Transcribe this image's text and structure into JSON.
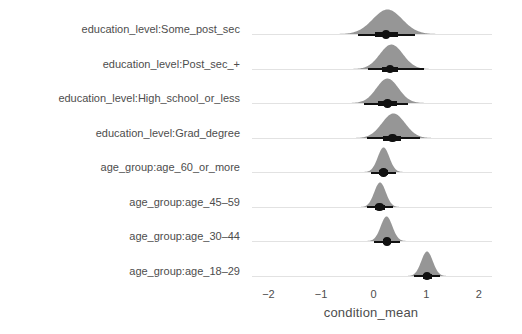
{
  "chart_data": {
    "type": "area",
    "title": "",
    "xlabel": "condition_mean",
    "ylabel": "group",
    "xlim": [
      -2.35,
      2.25
    ],
    "xticks": [
      -2,
      -1,
      0,
      1,
      2
    ],
    "xtick_labels": [
      "−2",
      "−1",
      "0",
      "1",
      "2"
    ],
    "grid": false,
    "legend": "none",
    "categories": [
      "education_level:Some_post_sec",
      "education_level:Post_sec_+",
      "education_level:High_school_or_less",
      "education_level:Grad_degree",
      "age_group:age_60_or_more",
      "age_group:age_45–59",
      "age_group:age_30–44",
      "age_group:age_18–29"
    ],
    "series": [
      {
        "name": "education_level:Some_post_sec",
        "point_estimate": 0.24,
        "inner_interval": [
          0.02,
          0.46
        ],
        "outer_interval": [
          -0.29,
          0.78
        ],
        "density_mean": 0.26,
        "density_sd": 0.28,
        "density_range": [
          -0.7,
          1.22
        ]
      },
      {
        "name": "education_level:Post_sec_+",
        "point_estimate": 0.31,
        "inner_interval": [
          0.15,
          0.47
        ],
        "outer_interval": [
          -0.1,
          0.95
        ],
        "density_mean": 0.33,
        "density_sd": 0.22,
        "density_range": [
          -0.4,
          1.08
        ]
      },
      {
        "name": "education_level:High_school_or_less",
        "point_estimate": 0.26,
        "inner_interval": [
          0.08,
          0.44
        ],
        "outer_interval": [
          -0.18,
          0.66
        ],
        "density_mean": 0.27,
        "density_sd": 0.21,
        "density_range": [
          -0.48,
          1.0
        ]
      },
      {
        "name": "education_level:Grad_degree",
        "point_estimate": 0.36,
        "inner_interval": [
          0.18,
          0.52
        ],
        "outer_interval": [
          -0.12,
          0.88
        ],
        "density_mean": 0.37,
        "density_sd": 0.22,
        "density_range": [
          -0.4,
          1.1
        ]
      },
      {
        "name": "age_group:age_60_or_more",
        "point_estimate": 0.19,
        "inner_interval": [
          0.1,
          0.28
        ],
        "outer_interval": [
          -0.05,
          0.43
        ],
        "density_mean": 0.19,
        "density_sd": 0.11,
        "density_range": [
          -0.22,
          0.6
        ]
      },
      {
        "name": "age_group:age_45–59",
        "point_estimate": 0.11,
        "inner_interval": [
          0.03,
          0.21
        ],
        "outer_interval": [
          -0.12,
          0.36
        ],
        "density_mean": 0.12,
        "density_sd": 0.11,
        "density_range": [
          -0.28,
          0.52
        ]
      },
      {
        "name": "age_group:age_30–44",
        "point_estimate": 0.25,
        "inner_interval": [
          0.17,
          0.33
        ],
        "outer_interval": [
          0.0,
          0.5
        ],
        "density_mean": 0.25,
        "density_sd": 0.11,
        "density_range": [
          -0.16,
          0.66
        ]
      },
      {
        "name": "age_group:age_18–29",
        "point_estimate": 1.02,
        "inner_interval": [
          0.94,
          1.11
        ],
        "outer_interval": [
          0.76,
          1.26
        ],
        "density_mean": 1.02,
        "density_sd": 0.11,
        "density_range": [
          0.62,
          1.42
        ]
      }
    ]
  },
  "axis": {
    "y_title": "group",
    "x_title": "condition_mean"
  }
}
